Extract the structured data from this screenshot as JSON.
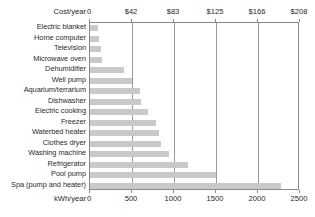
{
  "chart_data": {
    "type": "bar",
    "orientation": "horizontal",
    "title": "",
    "categories": [
      "Electric blanket",
      "Home computer",
      "Television",
      "Microwave oven",
      "Dehumidifier",
      "Well pump",
      "Aquarium/terrarium",
      "Dishwasher",
      "Electric cooking",
      "Freezer",
      "Waterbed heater",
      "Clothes dryer",
      "Washing machine",
      "Refrigerator",
      "Pool pump",
      "Spa (pump and heater)"
    ],
    "values": [
      95,
      110,
      130,
      140,
      400,
      500,
      600,
      610,
      690,
      790,
      825,
      850,
      945,
      1170,
      1500,
      2275
    ],
    "xlabel": "kWh/year",
    "xlabel_top": "Cost/year",
    "ylabel": "",
    "xlim": [
      0,
      2500
    ],
    "xlim_top": [
      0,
      208
    ],
    "xticks": [
      0,
      500,
      1000,
      1500,
      2000,
      2500
    ],
    "xticklabels": [
      "0",
      "500",
      "1000",
      "1500",
      "2000",
      "2500"
    ],
    "xticks_top": [
      0,
      41.6,
      83.2,
      124.8,
      166.4,
      208
    ],
    "xticklabels_top": [
      "0",
      "$42",
      "$83",
      "$125",
      "$166",
      "$208"
    ],
    "grid": true,
    "grid_axis": "x",
    "legend": "none",
    "bar_color": "#c9c9c9",
    "frame_color": "#8a8a8a",
    "background": "#ffffff"
  }
}
